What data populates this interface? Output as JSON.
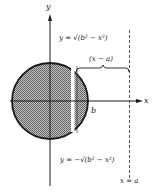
{
  "diagram": {
    "axes": {
      "x_label": "x",
      "y_label": "y"
    },
    "curves": {
      "upper": "y = √(b² − x²)",
      "lower": "y = −√(b² − x²)"
    },
    "brace_label": "(x − a)",
    "radius_label": "b",
    "line_label": "x = a",
    "colors": {
      "ink": "#1a1a1a",
      "fill": "#9a9a9a",
      "background": "#ffffff"
    }
  }
}
